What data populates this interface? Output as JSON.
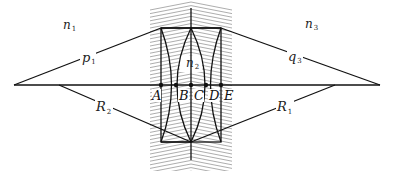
{
  "diagram": {
    "title": "",
    "media_labels": {
      "n1": {
        "base": "n",
        "sub": "1"
      },
      "n2": {
        "base": "n",
        "sub": "2"
      },
      "n3": {
        "base": "n",
        "sub": "3"
      }
    },
    "distance_labels": {
      "p1": {
        "base": "p",
        "sub": "1"
      },
      "q3": {
        "base": "q",
        "sub": "3"
      },
      "R1": {
        "base": "R",
        "sub": "1"
      },
      "R2": {
        "base": "R",
        "sub": "2"
      }
    },
    "axis_points": [
      {
        "label": "A"
      },
      {
        "label": "B"
      },
      {
        "label": "C"
      },
      {
        "label": "D"
      },
      {
        "label": "E"
      }
    ],
    "colors": {
      "line": "#111111",
      "hatch": "#8a8a8a",
      "background": "#ffffff"
    }
  }
}
